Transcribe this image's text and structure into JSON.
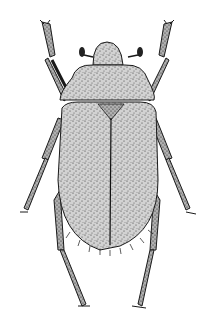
{
  "image": {
    "subject": "beetle illustration",
    "style": "stippled black-and-white scientific drawing",
    "view": "dorsal",
    "colors": {
      "background": "#ffffff",
      "body_fill": "#c8c8c8",
      "outline": "#1a1a1a",
      "stipple": "#333333",
      "eye": "#222222"
    }
  }
}
